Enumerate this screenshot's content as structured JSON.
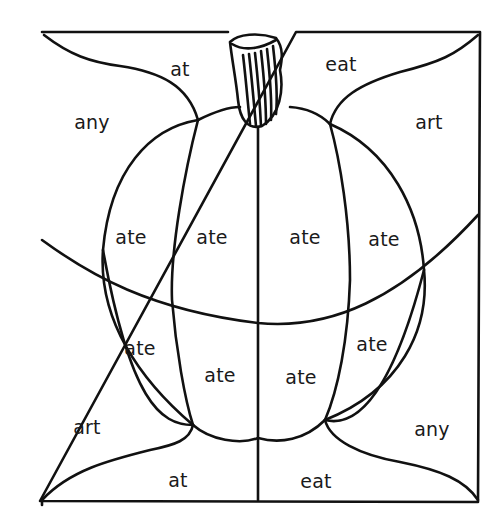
{
  "worksheet": {
    "picture": "pumpkin",
    "colors": {
      "line": "#111111",
      "background": "#ffffff",
      "text": "#1a1a1a"
    },
    "regions": [
      {
        "id": "top-left-corner",
        "word": "at",
        "x": 180,
        "y": 69
      },
      {
        "id": "top-right-corner",
        "word": "eat",
        "x": 341,
        "y": 64
      },
      {
        "id": "left-upper",
        "word": "any",
        "x": 92,
        "y": 122
      },
      {
        "id": "right-upper",
        "word": "art",
        "x": 429,
        "y": 122
      },
      {
        "id": "pumpkin-upper-1",
        "word": "ate",
        "x": 131,
        "y": 237
      },
      {
        "id": "pumpkin-upper-2",
        "word": "ate",
        "x": 212,
        "y": 237
      },
      {
        "id": "pumpkin-upper-3",
        "word": "ate",
        "x": 305,
        "y": 237
      },
      {
        "id": "pumpkin-upper-4",
        "word": "ate",
        "x": 384,
        "y": 239
      },
      {
        "id": "pumpkin-lower-1",
        "word": "ate",
        "x": 140,
        "y": 348
      },
      {
        "id": "pumpkin-lower-2",
        "word": "ate",
        "x": 220,
        "y": 375
      },
      {
        "id": "pumpkin-lower-3",
        "word": "ate",
        "x": 301,
        "y": 377
      },
      {
        "id": "pumpkin-lower-4",
        "word": "ate",
        "x": 372,
        "y": 344
      },
      {
        "id": "left-lower",
        "word": "art",
        "x": 87,
        "y": 427
      },
      {
        "id": "right-lower",
        "word": "any",
        "x": 432,
        "y": 429
      },
      {
        "id": "bottom-left-corner",
        "word": "at",
        "x": 178,
        "y": 480
      },
      {
        "id": "bottom-right-corner",
        "word": "eat",
        "x": 316,
        "y": 481
      }
    ]
  }
}
